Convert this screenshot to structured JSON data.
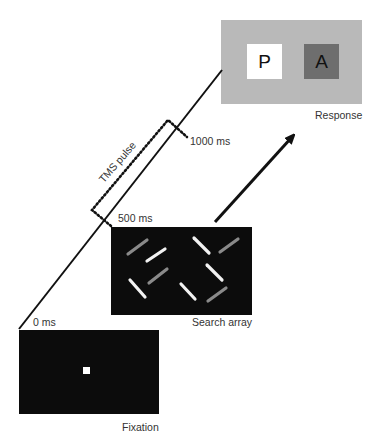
{
  "colors": {
    "panel_dark": "#0c0c0c",
    "response_bg": "#b9b9b9",
    "p_box": "#ffffff",
    "a_box": "#6e6e6e",
    "bar_white": "#f2f2f2",
    "bar_gray": "#8a8a8a",
    "line": "#111111"
  },
  "timeline": {
    "t0_label": "0 ms",
    "t500_label": "500 ms",
    "t1000_label": "1000 ms"
  },
  "tms": {
    "label": "TMS pulse"
  },
  "panels": {
    "fixation": {
      "label": "Fixation"
    },
    "search": {
      "label": "Search array",
      "bars": [
        {
          "x1": 128,
          "y1": 254,
          "x2": 147,
          "y2": 240,
          "tone": "gray"
        },
        {
          "x1": 147,
          "y1": 261,
          "x2": 165,
          "y2": 249,
          "tone": "white"
        },
        {
          "x1": 194,
          "y1": 238,
          "x2": 209,
          "y2": 253,
          "tone": "white"
        },
        {
          "x1": 220,
          "y1": 252,
          "x2": 238,
          "y2": 239,
          "tone": "gray"
        },
        {
          "x1": 149,
          "y1": 283,
          "x2": 167,
          "y2": 269,
          "tone": "gray"
        },
        {
          "x1": 207,
          "y1": 265,
          "x2": 222,
          "y2": 280,
          "tone": "white"
        },
        {
          "x1": 130,
          "y1": 280,
          "x2": 145,
          "y2": 297,
          "tone": "white"
        },
        {
          "x1": 181,
          "y1": 284,
          "x2": 195,
          "y2": 299,
          "tone": "white"
        },
        {
          "x1": 208,
          "y1": 301,
          "x2": 226,
          "y2": 288,
          "tone": "gray"
        }
      ]
    },
    "response": {
      "label": "Response",
      "option_left": "P",
      "option_right": "A"
    }
  }
}
